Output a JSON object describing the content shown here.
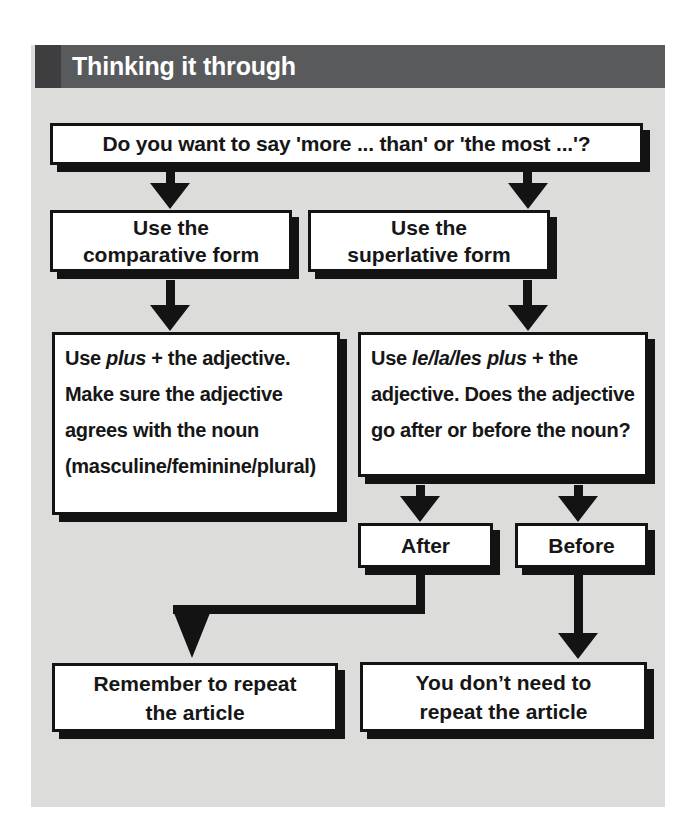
{
  "header": {
    "title": "Thinking it through"
  },
  "flowchart": {
    "question": "Do you want to say 'more ... than' or 'the most ...'?",
    "comparative_branch": {
      "line1": "Use the",
      "line2": "comparative form"
    },
    "superlative_branch": {
      "line1": "Use the",
      "line2": "superlative form"
    },
    "comparative_rule": {
      "pre": "Use ",
      "italic": "plus",
      "post": " + the adjective. Make sure the adjective agrees with the noun (masculine/feminine/​plural)"
    },
    "superlative_rule": {
      "pre": "Use ",
      "italic": "le/la/les plus",
      "post": " + the adjective. Does the adjective go after or before the noun?"
    },
    "after": {
      "label": "After",
      "result_line1": "Remember to repeat",
      "result_line2": "the article"
    },
    "before": {
      "label": "Before",
      "result_line1": "You don’t need to",
      "result_line2": "repeat the article"
    }
  },
  "colors": {
    "header_bar": "#595a5c",
    "header_accent": "#3e3e40",
    "panel_bg": "#dcdcda",
    "box_bg": "#ffffff",
    "ink": "#131313"
  }
}
